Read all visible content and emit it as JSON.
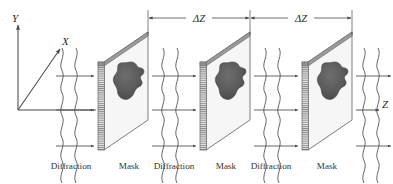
{
  "figure": {
    "background_color": "#ffffff",
    "line_color": "#4a4a4a",
    "mask_face_color": "#f4f4f4",
    "mask_edge_color": "#8a8a8a",
    "blob_color": "#595959",
    "text_color": "#2b2b2b"
  },
  "axes": {
    "y_label": "Y",
    "x_label": "X",
    "z_label": "Z"
  },
  "dimensions": [
    {
      "label": "ΔZ"
    },
    {
      "label": "ΔZ"
    }
  ],
  "captions": [
    {
      "label": "Diffraction"
    },
    {
      "label": "Mask"
    },
    {
      "label": "Diffraction"
    },
    {
      "label": "Mask"
    },
    {
      "label": "Diffraction"
    },
    {
      "label": "Mask"
    }
  ],
  "stages": [
    {
      "name": "diffraction-zone-1",
      "kind": "diffraction"
    },
    {
      "name": "mask-plane-1",
      "kind": "mask"
    },
    {
      "name": "diffraction-zone-2",
      "kind": "diffraction"
    },
    {
      "name": "mask-plane-2",
      "kind": "mask"
    },
    {
      "name": "diffraction-zone-3",
      "kind": "diffraction"
    },
    {
      "name": "mask-plane-3",
      "kind": "mask"
    },
    {
      "name": "diffraction-zone-4",
      "kind": "diffraction"
    }
  ]
}
